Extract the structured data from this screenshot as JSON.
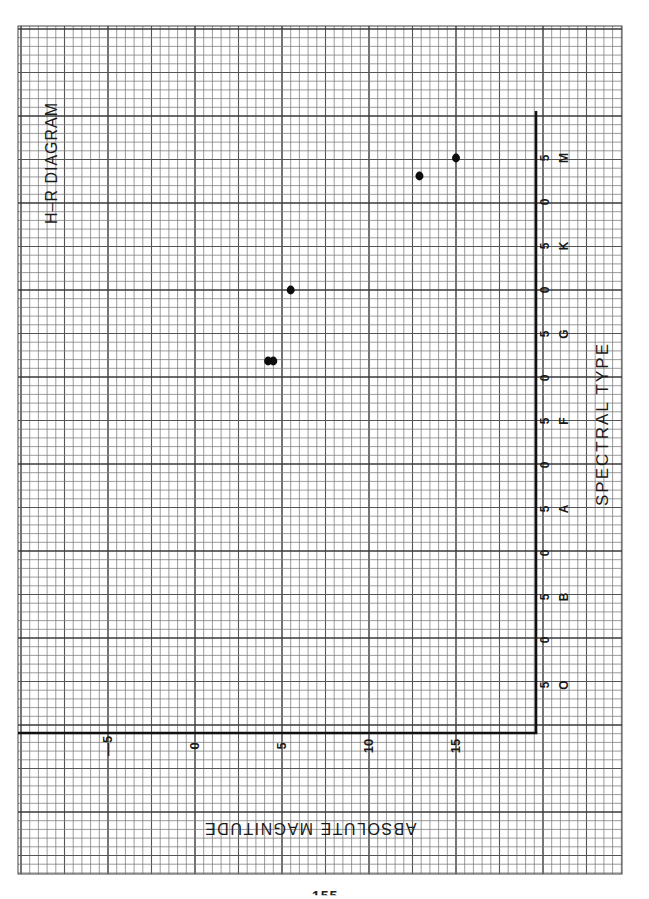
{
  "page": {
    "background": "#ffffff",
    "page_number_fragment": "155"
  },
  "paper": {
    "left": 18,
    "top": 26,
    "right": 622,
    "bottom": 874,
    "cell": 8.7,
    "origin_x": 195,
    "origin_y": 290,
    "minor_color": "#7a7a7a",
    "major_color": "#3a3a3a",
    "axis_color": "#111111"
  },
  "chart_data": {
    "type": "scatter",
    "title": "H–R DIAGRAM",
    "xlabel": "SPECTRAL TYPE",
    "ylabel": "ABSOLUTE MAGNITUDE",
    "orientation_note": "Sheet is printed rotated; spectral type axis runs vertically on the right, magnitude axis horizontally along the bottom (labels upside down).",
    "grid": true,
    "spectral_axis": {
      "classes": [
        "O",
        "B",
        "A",
        "F",
        "G",
        "K",
        "M"
      ],
      "tick_labels": [
        "5",
        "0",
        "5",
        "0",
        "5",
        "0",
        "5",
        "0",
        "5",
        "0",
        "5",
        "0",
        "5"
      ],
      "tick_values": [
        "O5",
        "B0",
        "B5",
        "A0",
        "A5",
        "F0",
        "F5",
        "G0",
        "G5",
        "K0",
        "K5",
        "M0",
        "M5"
      ]
    },
    "magnitude_axis": {
      "tick_labels": [
        "-5",
        "0",
        "5",
        "10",
        "15"
      ],
      "tick_values": [
        -5,
        0,
        5,
        10,
        15
      ],
      "range": [
        -9.5,
        19.5
      ]
    },
    "points": [
      {
        "spectral": "K0",
        "magnitude": 5.5
      },
      {
        "spectral": "G2",
        "magnitude": 4.2
      },
      {
        "spectral": "G2",
        "magnitude": 4.5
      },
      {
        "spectral": "M3",
        "magnitude": 12.9
      },
      {
        "spectral": "M5",
        "magnitude": 15.0
      }
    ]
  },
  "layout": {
    "axis_v_x": 536,
    "axis_v_top": 111,
    "axis_h_y": 733,
    "axis_h_left": 18,
    "mag_px_per_unit": 17.4,
    "mag_zero_x": 195,
    "spectral_y": {
      "O5": 685,
      "B0": 640,
      "B5": 597,
      "A0": 553,
      "A5": 509,
      "F0": 465,
      "F5": 421,
      "G0": 378,
      "G2": 361,
      "G5": 334,
      "K0": 290,
      "K5": 246,
      "M0": 202,
      "M3": 176,
      "M5": 158
    },
    "class_letter_y": {
      "O": 685,
      "B": 597,
      "A": 509,
      "F": 421,
      "G": 334,
      "K": 246,
      "M": 158
    },
    "point_pixel_offsets": [
      0,
      -3,
      3,
      0,
      0
    ]
  },
  "labels": {
    "title": "H–R DIAGRAM",
    "spectral_title": "SPECTRAL TYPE",
    "magnitude_title": "ABSOLUTE MAGNITUDE"
  }
}
